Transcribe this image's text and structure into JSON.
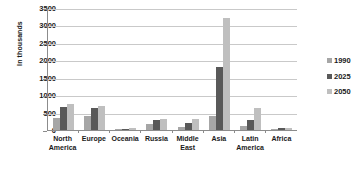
{
  "chart_data": {
    "type": "bar",
    "title": "",
    "xlabel": "",
    "ylabel": "In thousands",
    "ylim": [
      0,
      3500
    ],
    "ytick_step": 500,
    "ytick_labels": [
      "3500",
      "3000",
      "2500",
      "2000",
      "1500",
      "1000",
      "500",
      "0"
    ],
    "grid": true,
    "legend_position": "right",
    "categories": [
      "North America",
      "Europe",
      "Oceania",
      "Russia",
      "Middle East",
      "Asia",
      "Latin America",
      "Africa"
    ],
    "series": [
      {
        "name": "1990",
        "color": "#a6a6a6",
        "values": [
          350,
          390,
          20,
          180,
          90,
          400,
          110,
          30
        ]
      },
      {
        "name": "2025",
        "color": "#595959",
        "values": [
          660,
          630,
          35,
          300,
          210,
          1800,
          300,
          55
        ]
      },
      {
        "name": "2050",
        "color": "#bfbfbf",
        "values": [
          750,
          690,
          45,
          310,
          330,
          3200,
          620,
          70
        ]
      }
    ]
  },
  "axis": {
    "y_label": "In thousands"
  },
  "legend": {
    "items": [
      {
        "label": "1990",
        "color": "#a6a6a6"
      },
      {
        "label": "2025",
        "color": "#595959"
      },
      {
        "label": "2050",
        "color": "#bfbfbf"
      }
    ]
  },
  "colors": {
    "axis": "#8c8c8c",
    "grid": "#c9c9c9",
    "text": "#1a1a1a",
    "background": "#ffffff"
  }
}
